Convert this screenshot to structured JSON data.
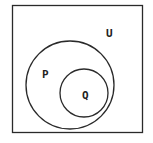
{
  "diagram": {
    "type": "venn",
    "universe": {
      "label": "U"
    },
    "sets": [
      {
        "label": "P"
      },
      {
        "label": "Q"
      }
    ],
    "relation": "Q subset of P subset of U"
  },
  "colors": {
    "stroke": "#2a2a2a",
    "background": "#ffffff"
  }
}
